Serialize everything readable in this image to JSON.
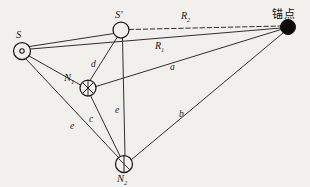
{
  "figure": {
    "type": "geometry-diagram",
    "background_color": "#f2f0ec",
    "ink_color": "#1a1a1a"
  },
  "nodes": [
    {
      "id": "S",
      "label": "S",
      "sub": "",
      "x": 22,
      "y": 51,
      "r": 8.5,
      "glyph": "circle-dot",
      "label_dx": -2,
      "label_dy": -19
    },
    {
      "id": "Sp",
      "label": "S",
      "sub": "",
      "prime": "'",
      "x": 121,
      "y": 30,
      "r": 8.0,
      "glyph": "circle-open",
      "label_dx": -2,
      "label_dy": -18
    },
    {
      "id": "N1",
      "label": "N",
      "sub": "1",
      "x": 88,
      "y": 88,
      "r": 8.0,
      "glyph": "circle-cross",
      "label_dx": -22,
      "label_dy": -13
    },
    {
      "id": "N2",
      "label": "N",
      "sub": "2",
      "x": 124,
      "y": 164,
      "r": 8.5,
      "glyph": "circle-cross",
      "label_dx": -5,
      "label_dy": 13
    }
  ],
  "anchor": {
    "id": "anchor",
    "label": "锚点",
    "x": 288,
    "y": 27,
    "r": 7.5,
    "fill": "#0b0b0b",
    "label_dx": -12,
    "label_dy": -20
  },
  "edges": [
    {
      "id": "S-anchor",
      "from": "S",
      "to": "anchor",
      "style": "solid",
      "label": "R",
      "sub": "1",
      "lx": 160,
      "ly": 47
    },
    {
      "id": "Sp-anchor",
      "from": "Sp",
      "to": "anchor",
      "style": "dashed",
      "label": "R",
      "sub": "2",
      "lx": 186,
      "ly": 17
    },
    {
      "id": "N1-anchor",
      "from": "N1",
      "to": "anchor",
      "style": "solid",
      "label": "a",
      "sub": "",
      "lx": 172,
      "ly": 69
    },
    {
      "id": "N2-anchor",
      "from": "N2",
      "to": "anchor",
      "style": "solid",
      "label": "b",
      "sub": "",
      "lx": 181,
      "ly": 116
    },
    {
      "id": "S-Sp",
      "from": "S",
      "to": "Sp",
      "style": "solid",
      "label": "",
      "sub": "",
      "lx": 0,
      "ly": 0
    },
    {
      "id": "S-N1",
      "from": "S",
      "to": "N1",
      "style": "solid",
      "label": "",
      "sub": "",
      "lx": 0,
      "ly": 0
    },
    {
      "id": "S-N2",
      "from": "S",
      "to": "N2",
      "style": "solid",
      "label": "d",
      "sub": "",
      "lx": 62,
      "ly": 102
    },
    {
      "id": "S-N2-e",
      "from": "S",
      "to": "N2",
      "style": "none",
      "label": "e",
      "sub": "",
      "lx": 72,
      "ly": 128
    },
    {
      "id": "N1-Sp",
      "from": "N1",
      "to": "Sp",
      "style": "solid",
      "label": "d",
      "sub": "",
      "lx": 93,
      "ly": 66
    },
    {
      "id": "N1-N2",
      "from": "N1",
      "to": "N2",
      "style": "solid",
      "label": "c",
      "sub": "",
      "lx": 91,
      "ly": 121
    },
    {
      "id": "Sp-N2",
      "from": "Sp",
      "to": "N2",
      "style": "solid",
      "label": "e",
      "sub": "",
      "lx": 117,
      "ly": 112
    }
  ],
  "ghost_text": {
    "top_left": "",
    "bottom_left": ""
  }
}
